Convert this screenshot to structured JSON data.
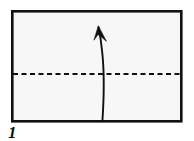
{
  "figure": {
    "step_number": "1",
    "canvas": {
      "width": 194,
      "height": 141,
      "background": "#ffffff"
    },
    "paper": {
      "name": "rectangular sheet",
      "shape": "rectangle",
      "x": 11,
      "y": 10,
      "width": 171,
      "height": 112,
      "fill": "#f7f7f8",
      "stroke": "#111111",
      "stroke_width": 2.6
    },
    "fold_line": {
      "name": "valley fold line",
      "style": "dashed",
      "orientation": "horizontal",
      "y": 74,
      "x_start": 13,
      "x_end": 181,
      "dash": "5 3.5",
      "stroke": "#111111",
      "stroke_width": 2.2
    },
    "fold_arrow": {
      "name": "fold direction arrow",
      "direction": "up",
      "curved": true,
      "tail_x": 102,
      "tail_y": 121,
      "tip_x": 98,
      "tip_y": 26,
      "stroke": "#111111",
      "stroke_width": 1.8,
      "path": "M 102.4 121 C 103.6 98 104.2 72 101.6 48 C 100.4 38 99.2 31 98.4 27",
      "head_path": "M 98.4 26.2 L 94.2 39.6 L 98.9 35.6 L 105.6 40.4 Z"
    }
  }
}
